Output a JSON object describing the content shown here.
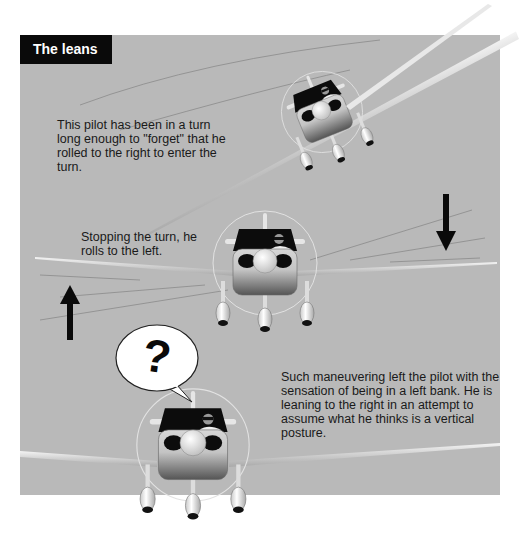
{
  "figure": {
    "title": "The leans",
    "captions": [
      "This pilot has been in a turn long enough to \"forget\" that he rolled to the right to enter the turn.",
      "Stopping the turn, he rolls to the left.",
      "Such maneuvering left the pilot with the sensation of being in a left bank. He is leaning to the right in an attempt to assume what he thinks is a vertical posture."
    ],
    "speech_bubble": "?",
    "arrows": [
      {
        "direction": "down",
        "side": "right"
      },
      {
        "direction": "up",
        "side": "left"
      }
    ],
    "colors": {
      "background": "#b9b9b9",
      "title_bg": "#0a0a0a",
      "title_text": "#ffffff",
      "arrow": "#0a0a0a"
    }
  }
}
